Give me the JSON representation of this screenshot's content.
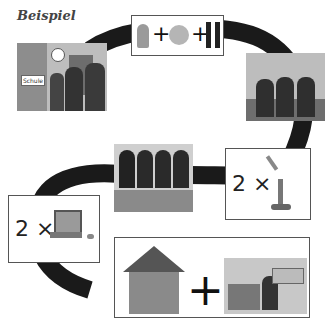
{
  "title": "Beispiel",
  "steps": [
    {
      "id": "school",
      "sign": "Schule",
      "icons": [
        "clock-icon"
      ]
    },
    {
      "id": "egypt-earth-france",
      "icons": [
        "pharaoh-icon",
        "globe-icon",
        "france-icon"
      ],
      "operators": [
        "+",
        "+"
      ]
    },
    {
      "id": "playground-friends"
    },
    {
      "id": "bunsen-burner",
      "count": "2 ×",
      "icons": [
        "test-tube-icon",
        "bunsen-burner-icon"
      ]
    },
    {
      "id": "girls-at-table"
    },
    {
      "id": "laptop",
      "count": "2 ×",
      "icons": [
        "laptop-icon",
        "mouse-icon"
      ]
    },
    {
      "id": "home-study",
      "operator": "+",
      "icons": [
        "house-icon",
        "studying-at-desk-icon"
      ]
    }
  ],
  "colors": {
    "path": "#1a1a1a",
    "card_border": "#555555",
    "title": "#444444"
  }
}
